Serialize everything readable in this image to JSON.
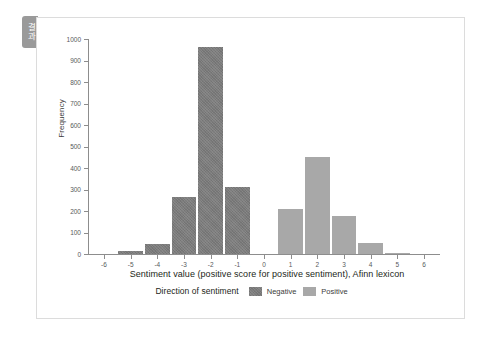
{
  "side_tab": {
    "label": "결과",
    "color": "#9a9a9a"
  },
  "card": {
    "border_color": "#dcdcdc",
    "background": "#ffffff"
  },
  "chart_data": {
    "type": "bar",
    "title": "",
    "xlabel": "Sentiment value (positive score for positive sentiment), Afinn lexicon",
    "ylabel": "Frequency",
    "categories": [
      "-5",
      "-4",
      "-3",
      "-2",
      "-1",
      "1",
      "2",
      "3",
      "4",
      "5"
    ],
    "values": [
      15,
      45,
      263,
      965,
      310,
      210,
      450,
      175,
      50,
      5
    ],
    "bar_groups": [
      "Negative",
      "Negative",
      "Negative",
      "Negative",
      "Negative",
      "Positive",
      "Positive",
      "Positive",
      "Positive",
      "Positive"
    ],
    "series": [
      {
        "name": "Negative",
        "color": "#7b7b7b",
        "points": [
          {
            "x": -5,
            "y": 15
          },
          {
            "x": -4,
            "y": 45
          },
          {
            "x": -3,
            "y": 263
          },
          {
            "x": -2,
            "y": 965
          },
          {
            "x": -1,
            "y": 310
          }
        ]
      },
      {
        "name": "Positive",
        "color": "#a8a8a8",
        "points": [
          {
            "x": 1,
            "y": 210
          },
          {
            "x": 2,
            "y": 450
          },
          {
            "x": 3,
            "y": 175
          },
          {
            "x": 4,
            "y": 50
          },
          {
            "x": 5,
            "y": 5
          }
        ]
      }
    ],
    "xlim": [
      -6.6,
      6.6
    ],
    "ylim": [
      0,
      1000
    ],
    "x_ticks": [
      -6,
      -5,
      -4,
      -3,
      -2,
      -1,
      0,
      1,
      2,
      3,
      4,
      5,
      6
    ],
    "y_ticks": [
      0,
      100,
      200,
      300,
      400,
      500,
      600,
      700,
      800,
      900,
      1000
    ],
    "grid": false,
    "legend_position": "bottom",
    "legend_title": "Direction of sentiment",
    "legend_entries": [
      {
        "label": "Negative",
        "color": "#7b7b7b"
      },
      {
        "label": "Positive",
        "color": "#a8a8a8"
      }
    ]
  }
}
